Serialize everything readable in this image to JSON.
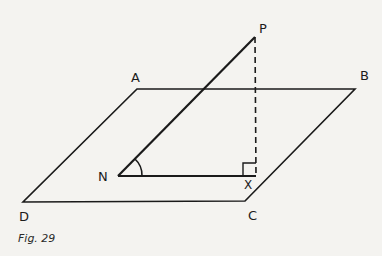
{
  "figure": {
    "caption": "Fig. 29",
    "points": {
      "P": {
        "label": "P",
        "x": 255,
        "y": 37
      },
      "A": {
        "label": "A",
        "x": 137,
        "y": 89
      },
      "B": {
        "label": "B",
        "x": 355,
        "y": 89
      },
      "C": {
        "label": "C",
        "x": 245,
        "y": 201
      },
      "D": {
        "label": "D",
        "x": 23,
        "y": 202
      },
      "N": {
        "label": "N",
        "x": 118,
        "y": 176
      },
      "X": {
        "label": "X",
        "x": 256,
        "y": 176
      }
    },
    "stroke_color": "#1a1a1a",
    "background": "#f4f3f0"
  }
}
